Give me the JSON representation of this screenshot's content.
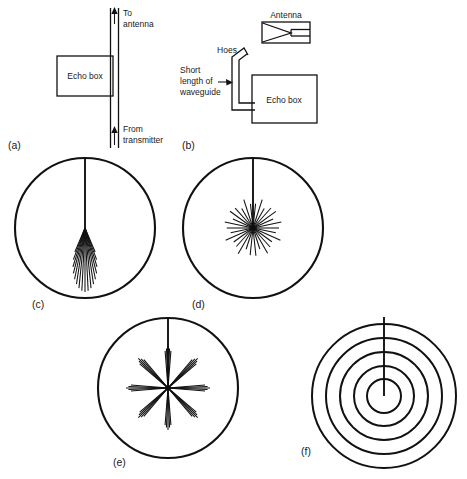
{
  "figure": {
    "background_color": "#ffffff",
    "ink_color": "#111111",
    "panels": [
      {
        "key": "a",
        "caption": "(a)",
        "type": "schematic",
        "labels": {
          "to_antenna": "To\nantenna",
          "to_antenna_line1": "To",
          "to_antenna_line2": "antenna",
          "from_transmitter_line1": "From",
          "from_transmitter_line2": "transmitter",
          "echo_box": "Echo box"
        }
      },
      {
        "key": "b",
        "caption": "(b)",
        "type": "schematic",
        "labels": {
          "antenna": "Antenna",
          "horn": "Hoes",
          "short_length_line1": "Short",
          "short_length_line2": "length of",
          "short_length_line3": "waveguide",
          "echo_box": "Echo box"
        }
      },
      {
        "key": "c",
        "caption": "(c)",
        "type": "ppi-scope",
        "description": "Narrow downward fan of ring-time spikes"
      },
      {
        "key": "d",
        "caption": "(d)",
        "type": "ppi-scope",
        "description": "Full starburst of ring-time spikes"
      },
      {
        "key": "e",
        "caption": "(e)",
        "type": "ppi-scope",
        "description": "Eight clustered spoke groups"
      },
      {
        "key": "f",
        "caption": "(f)",
        "type": "ppi-scope",
        "description": "Five concentric rings with vertical sweep"
      }
    ]
  },
  "chart_data": {
    "type": "diagram",
    "panels": [
      {
        "id": "a",
        "caption": "(a)",
        "kind": "waveguide-schematic",
        "elements": [
          {
            "name": "vertical-waveguide",
            "x": 112,
            "y_top": 8,
            "y_bottom": 148,
            "width": 7
          },
          {
            "name": "arrow-up-top",
            "x": 115,
            "y": 12,
            "direction": "up"
          },
          {
            "name": "arrow-up-bottom",
            "x": 115,
            "y": 131,
            "direction": "up"
          },
          {
            "name": "echo-box-rect",
            "x": 57,
            "y": 56,
            "w": 58,
            "h": 40
          }
        ],
        "texts": [
          {
            "text": "To",
            "x": 124,
            "y": 15
          },
          {
            "text": "antenna",
            "x": 124,
            "y": 26
          },
          {
            "text": "From",
            "x": 124,
            "y": 131
          },
          {
            "text": "transmitter",
            "x": 124,
            "y": 142
          },
          {
            "text": "Echo box",
            "x": 86,
            "y": 79
          },
          {
            "text": "(a)",
            "x": 14,
            "y": 146
          }
        ]
      },
      {
        "id": "b",
        "caption": "(b)",
        "kind": "horn-echo-box-schematic",
        "elements": [
          {
            "name": "antenna-rect",
            "x": 263,
            "y": 22,
            "w": 46,
            "h": 20
          },
          {
            "name": "antenna-horn-triangle",
            "points": "263,41 290,32 263,23"
          },
          {
            "name": "antenna-feed-lines",
            "x1": 290,
            "x2": 309,
            "y_top": 29,
            "y_bottom": 36
          },
          {
            "name": "echo-box-rect",
            "x": 252,
            "y": 75,
            "w": 65,
            "h": 48
          },
          {
            "name": "waveguide-path",
            "description": "bent double line from horn down to echo box"
          },
          {
            "name": "pointer-arrow",
            "x": 216,
            "y": 80,
            "direction": "right"
          }
        ],
        "texts": [
          {
            "text": "Antenna",
            "x": 286,
            "y": 18
          },
          {
            "text": "Hoes",
            "x": 227,
            "y": 52
          },
          {
            "text": "Short",
            "x": 181,
            "y": 72
          },
          {
            "text": "length of",
            "x": 181,
            "y": 83
          },
          {
            "text": "waveguide",
            "x": 181,
            "y": 94
          },
          {
            "text": "Echo box",
            "x": 284,
            "y": 102
          },
          {
            "text": "(b)",
            "x": 186,
            "y": 146
          }
        ]
      },
      {
        "id": "c",
        "caption": "(c)",
        "kind": "ppi-scope",
        "center": {
          "cx": 85,
          "cy": 228
        },
        "radius": 70,
        "sweep_line": {
          "from_angle_deg": 90,
          "to_center": true
        },
        "spikes": {
          "count": 17,
          "direction_deg": 270,
          "spread_deg": 46,
          "length_min": 26,
          "length_max": 64,
          "origin": "center"
        },
        "label_pos": {
          "x": 36,
          "y": 305
        }
      },
      {
        "id": "d",
        "caption": "(d)",
        "kind": "ppi-scope",
        "center": {
          "cx": 253,
          "cy": 228
        },
        "radius": 70,
        "sweep_line": {
          "from_angle_deg": 90,
          "to_center": true
        },
        "spikes": {
          "count": 30,
          "direction_deg": 0,
          "spread_deg": 360,
          "length_min": 22,
          "length_max": 30,
          "origin": "center"
        },
        "label_pos": {
          "x": 196,
          "y": 305
        }
      },
      {
        "id": "e",
        "caption": "(e)",
        "kind": "ppi-scope",
        "center": {
          "cx": 168,
          "cy": 388
        },
        "radius": 70,
        "sweep_line": {
          "from_angle_deg": 90,
          "to_center": true
        },
        "spike_clusters": {
          "cluster_count": 8,
          "cluster_angles_deg": [
            0,
            45,
            90,
            135,
            180,
            225,
            270,
            315
          ],
          "spikes_per_cluster": 5,
          "cluster_spread_deg": 9,
          "length_min": 34,
          "length_max": 42
        },
        "label_pos": {
          "x": 117,
          "y": 462
        }
      },
      {
        "id": "f",
        "caption": "(f)",
        "kind": "ppi-scope-rings",
        "center": {
          "cx": 384,
          "cy": 396
        },
        "ring_radii": [
          72,
          58,
          44,
          30,
          17
        ],
        "ring_count": 5,
        "sweep_line": {
          "from_angle_deg": 90,
          "length": 79
        },
        "label_pos": {
          "x": 305,
          "y": 452
        }
      }
    ]
  }
}
